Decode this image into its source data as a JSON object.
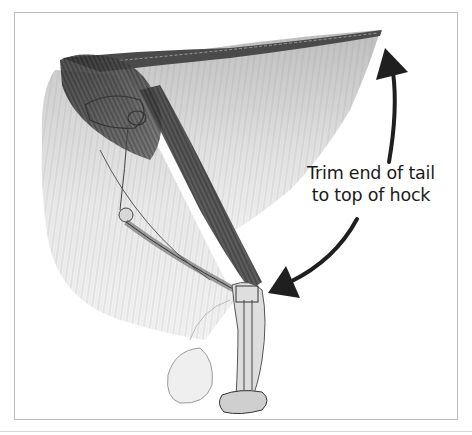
{
  "figure": {
    "caption_lines": [
      "Trim end of tail",
      "to top of hock"
    ],
    "arrows": [
      {
        "name": "arrow-to-tail-tip",
        "direction": "up"
      },
      {
        "name": "arrow-to-hock",
        "direction": "down-left"
      }
    ],
    "colors": {
      "frame": "#bdbdbd",
      "arrow": "#1f1f1f",
      "text": "#1a1a1a",
      "fur_light": "#e6e6e6",
      "fur_mid": "#a8a8a8",
      "muscle_dark": "#3a3a3a"
    }
  }
}
